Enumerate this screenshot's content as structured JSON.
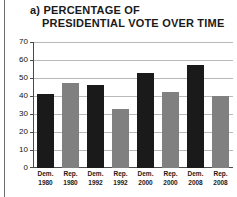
{
  "figure": {
    "title_line_1": "a) PERCENTAGE OF",
    "title_line_2": "PRESIDENTIAL VOTE OVER TIME"
  },
  "colors": {
    "democrat_bar": "#1a1a1a",
    "republican_bar": "#808080",
    "gridline": "#b9b9b9",
    "axis": "#4a4a4a",
    "text": "#1a1a1a",
    "background": "#ffffff"
  },
  "chart_data": {
    "type": "bar",
    "title": "a) PERCENTAGE OF PRESIDENTIAL VOTE OVER TIME",
    "xlabel": "",
    "ylabel": "",
    "ylim": [
      0,
      70
    ],
    "yticks": [
      0,
      10,
      20,
      30,
      40,
      50,
      60,
      70
    ],
    "ytick_labels": [
      "0",
      "10",
      "20",
      "30",
      "40",
      "50",
      "60",
      "70"
    ],
    "grid": true,
    "legend": "none",
    "categories": [
      "Dem. 1980",
      "Rep. 1980",
      "Dem. 1992",
      "Rep. 1992",
      "Dem. 2000",
      "Rep. 2000",
      "Dem. 2008",
      "Rep. 2008"
    ],
    "values": [
      41,
      47,
      46,
      33,
      53,
      42,
      57,
      40
    ],
    "bars": [
      {
        "party": "Dem.",
        "year": "1980",
        "value": 41,
        "color": "#1a1a1a"
      },
      {
        "party": "Rep.",
        "year": "1980",
        "value": 47,
        "color": "#808080"
      },
      {
        "party": "Dem.",
        "year": "1992",
        "value": 46,
        "color": "#1a1a1a"
      },
      {
        "party": "Rep.",
        "year": "1992",
        "value": 33,
        "color": "#808080"
      },
      {
        "party": "Dem.",
        "year": "2000",
        "value": 53,
        "color": "#1a1a1a"
      },
      {
        "party": "Rep.",
        "year": "2000",
        "value": 42,
        "color": "#808080"
      },
      {
        "party": "Dem.",
        "year": "2008",
        "value": 57,
        "color": "#1a1a1a"
      },
      {
        "party": "Rep.",
        "year": "2008",
        "value": 40,
        "color": "#808080"
      }
    ]
  }
}
